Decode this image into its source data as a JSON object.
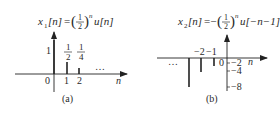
{
  "panels": [
    {
      "id": "a",
      "caption": "(a)",
      "formula": {
        "lhs": "x",
        "sub": "1",
        "arg": "[n]",
        "eq": "=",
        "frac_num": "1",
        "frac_den": "2",
        "exp": "n",
        "tail": "u[n]"
      },
      "axis_label": "n",
      "origin_label": "0",
      "x_ticks": [
        "1",
        "2"
      ],
      "value_labels": {
        "n0": "1",
        "n1_num": "1",
        "n1_den": "2",
        "n2_num": "1",
        "n2_den": "4"
      },
      "ellipsis": "…",
      "stems": [
        {
          "n": 0,
          "value": 1
        },
        {
          "n": 1,
          "value": 0.5
        },
        {
          "n": 2,
          "value": 0.25
        }
      ]
    },
    {
      "id": "b",
      "caption": "(b)",
      "formula": {
        "lhs": "x",
        "sub": "2",
        "arg": "[n]",
        "eq": "=−",
        "frac_num": "1",
        "frac_den": "2",
        "exp": "n",
        "tail": "u[−n−1]"
      },
      "axis_label": "n",
      "origin_label": "0",
      "x_ticks": [
        "−2",
        "−1"
      ],
      "y_ticks": [
        "−2",
        "−4",
        "−8"
      ],
      "ellipsis": "…",
      "stems": [
        {
          "n": -1,
          "value": -2
        },
        {
          "n": -2,
          "value": -4
        },
        {
          "n": -3,
          "value": -8
        }
      ]
    }
  ]
}
